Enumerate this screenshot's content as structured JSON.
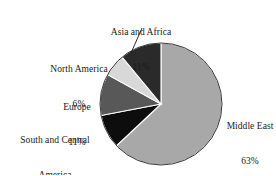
{
  "chart_data": {
    "type": "pie",
    "title": "",
    "subtitle": "",
    "xlabel": "",
    "ylabel": "",
    "legend_position": "none",
    "grid": false,
    "labels_on_slices": false,
    "start_angle_deg": 0,
    "direction": "clockwise",
    "categories": [
      "Middle East",
      "South and Central America",
      "Europe",
      "North America",
      "Asia and Africa"
    ],
    "values": [
      63,
      9,
      11,
      6,
      11
    ],
    "units": "%",
    "total": 100,
    "slices": [
      {
        "name": "Middle East",
        "value": 63,
        "value_text": "63%",
        "color": "#a8a8a8",
        "label_lines": [
          "Middle East",
          "63%"
        ],
        "leader_line": false
      },
      {
        "name": "South and Central America",
        "value": 9,
        "value_text": "9%",
        "color": "#0d0d0d",
        "label_lines": [
          "South and Central",
          "America",
          "9%"
        ],
        "leader_line": false
      },
      {
        "name": "Europe",
        "value": 11,
        "value_text": "11%",
        "color": "#585858",
        "label_lines": [
          "Europe",
          "11%"
        ],
        "leader_line": false
      },
      {
        "name": "North America",
        "value": 6,
        "value_text": "6%",
        "color": "#d8d8d8",
        "label_lines": [
          "North America",
          "6%"
        ],
        "leader_line": false
      },
      {
        "name": "Asia and Africa",
        "value": 11,
        "value_text": "11%",
        "color": "#2a2a2a",
        "label_lines": [
          "Asia and Africa",
          "11%"
        ],
        "leader_line": true
      }
    ]
  },
  "labels": {
    "asia_and_africa": {
      "name": "Asia and Africa",
      "value": "11%"
    },
    "north_america": {
      "name": "North America",
      "value": "6%"
    },
    "europe": {
      "name": "Europe",
      "value": "11%"
    },
    "south_and_central_america": {
      "name_line1": "South and Central",
      "name_line2": "America",
      "value": "9%"
    },
    "middle_east": {
      "name": "Middle East",
      "value": "63%"
    }
  },
  "style": {
    "background": "#ffffff",
    "outline": "#3a3a3a",
    "separator": "#ffffff",
    "text": "#1a1a1a"
  }
}
